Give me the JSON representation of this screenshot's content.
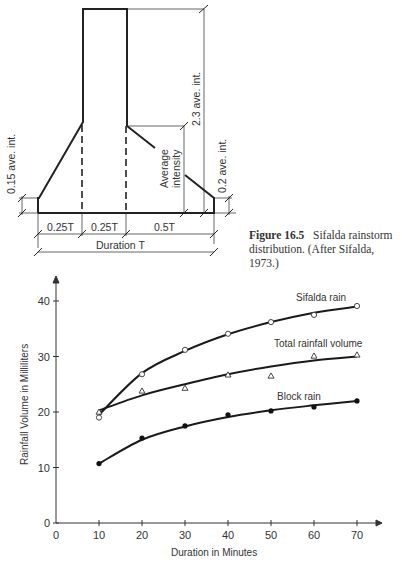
{
  "diagram": {
    "labels": {
      "left_height": "0.15 ave. int.",
      "peak_height": "2.3 ave. int.",
      "avg_intensity": "Average intensity",
      "avg_intensity_line1": "Average",
      "avg_intensity_line2": "intensity",
      "right_height": "0.2 ave. int.",
      "seg1": "0.25T",
      "seg2": "0.25T",
      "seg3": "0.5T",
      "duration": "Duration T"
    }
  },
  "caption": {
    "figure_label": "Figure 16.5",
    "text": "Sifalda rainstorm distribution. (After Sifalda, 1973.)"
  },
  "chart_data": {
    "type": "line",
    "title": "",
    "xlabel": "Duration in Minutes",
    "ylabel": "Rainfall Volume in Milliliters",
    "xlim": [
      0,
      75
    ],
    "ylim": [
      0,
      45
    ],
    "x_ticks": [
      0,
      10,
      20,
      30,
      40,
      50,
      60,
      70
    ],
    "y_ticks": [
      0,
      10,
      20,
      30,
      40
    ],
    "grid": false,
    "legend": "inline labels near curves",
    "x": [
      10,
      20,
      30,
      40,
      50,
      60,
      70
    ],
    "series": [
      {
        "name": "Sifalda rain",
        "marker": "open-circle",
        "values": [
          19.0,
          26.8,
          31.2,
          34.1,
          36.2,
          37.5,
          39.1
        ]
      },
      {
        "name": "Total rainfall volume",
        "marker": "open-triangle",
        "values": [
          20.0,
          23.8,
          24.3,
          26.7,
          26.5,
          30.1,
          30.3
        ]
      },
      {
        "name": "Block rain",
        "marker": "filled-circle",
        "values": [
          10.7,
          15.3,
          17.5,
          19.5,
          20.2,
          20.9,
          22.0
        ]
      }
    ],
    "fit_curves": [
      {
        "name": "Sifalda rain",
        "values": [
          19.5,
          27.0,
          31.0,
          34.0,
          36.2,
          37.9,
          39.0
        ]
      },
      {
        "name": "Total rainfall volume",
        "values": [
          20.3,
          23.0,
          25.0,
          26.8,
          28.2,
          29.3,
          30.0
        ]
      },
      {
        "name": "Block rain",
        "values": [
          10.7,
          15.0,
          17.4,
          19.1,
          20.3,
          21.2,
          22.0
        ]
      }
    ]
  }
}
